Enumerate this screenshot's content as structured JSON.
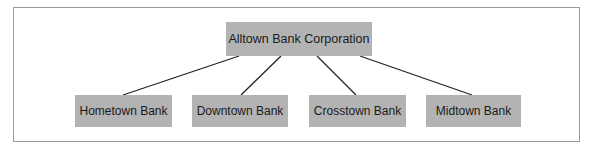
{
  "diagram": {
    "type": "org-chart",
    "root": {
      "label": "Alltown Bank Corporation"
    },
    "children": [
      {
        "label": "Hometown Bank"
      },
      {
        "label": "Downtown Bank"
      },
      {
        "label": "Crosstown Bank"
      },
      {
        "label": "Midtown Bank"
      }
    ],
    "edges": [
      {
        "from": "Alltown Bank Corporation",
        "to": "Hometown Bank"
      },
      {
        "from": "Alltown Bank Corporation",
        "to": "Downtown Bank"
      },
      {
        "from": "Alltown Bank Corporation",
        "to": "Crosstown Bank"
      },
      {
        "from": "Alltown Bank Corporation",
        "to": "Midtown Bank"
      }
    ]
  },
  "colors": {
    "node_fill": "#b3b3b3",
    "line": "#222222",
    "frame": "#9a9a9a",
    "text": "#1a1a1a"
  }
}
